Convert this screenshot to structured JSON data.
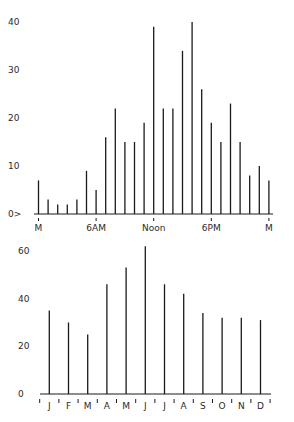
{
  "chart_data": [
    {
      "type": "bar",
      "title": "",
      "xlabel": "",
      "ylabel": "",
      "ylim": [
        0,
        40
      ],
      "yticks": [
        0,
        10,
        20,
        30,
        40
      ],
      "ytick_labels": [
        "0>",
        "10",
        "20",
        "30",
        "40"
      ],
      "x": [
        0,
        1,
        2,
        3,
        4,
        5,
        6,
        7,
        8,
        9,
        10,
        11,
        12,
        13,
        14,
        15,
        16,
        17,
        18,
        19,
        20,
        21,
        22,
        23,
        24
      ],
      "xtick_positions": [
        0,
        6,
        12,
        18,
        24
      ],
      "xtick_labels": [
        "M",
        "6AM",
        "Noon",
        "6PM",
        "M"
      ],
      "values": [
        7,
        3,
        2,
        2,
        3,
        9,
        5,
        16,
        22,
        15,
        15,
        19,
        39,
        22,
        22,
        34,
        40,
        26,
        19,
        15,
        23,
        15,
        8,
        10,
        7
      ],
      "grid": false,
      "legend": null
    },
    {
      "type": "bar",
      "title": "",
      "xlabel": "",
      "ylabel": "",
      "ylim": [
        0,
        60
      ],
      "yticks": [
        0,
        20,
        40,
        60
      ],
      "ytick_labels": [
        "0",
        "20",
        "40",
        "60"
      ],
      "categories": [
        "J",
        "F",
        "M",
        "A",
        "M",
        "J",
        "J",
        "A",
        "S",
        "O",
        "N",
        "D"
      ],
      "values": [
        35,
        30,
        25,
        46,
        53,
        62,
        46,
        42,
        34,
        32,
        32,
        31
      ],
      "grid": false,
      "legend": null
    }
  ],
  "colors": {
    "bar": "#1a1a1a",
    "axis": "#1a1a1a",
    "background": "#ffffff"
  }
}
